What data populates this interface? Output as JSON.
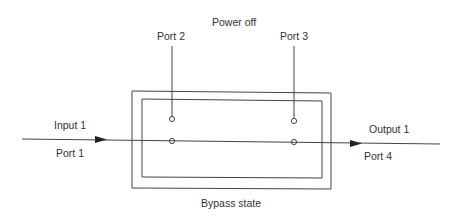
{
  "diagram": {
    "title": "Power off",
    "caption": "Bypass state",
    "ports": {
      "port1": "Port  1",
      "port2": "Port  2",
      "port3": "Port  3",
      "port4": "Port  4"
    },
    "signals": {
      "input": "Input 1",
      "output": "Output 1"
    },
    "colors": {
      "line": "#444444",
      "text": "#333333",
      "background": "#ffffff"
    }
  }
}
